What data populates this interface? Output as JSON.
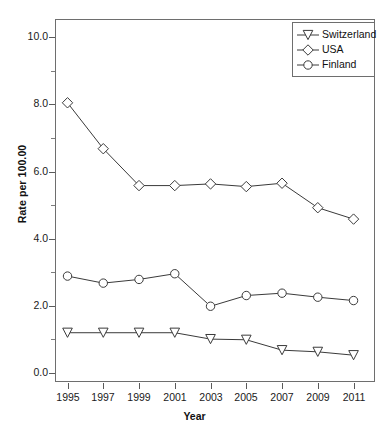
{
  "chart_data": {
    "type": "line",
    "title": "",
    "xlabel": "Year",
    "ylabel": "Rate per 100.00",
    "x": [
      1995,
      1997,
      1999,
      2001,
      2003,
      2005,
      2007,
      2009,
      2011
    ],
    "xtick_labels": [
      "1995",
      "1997",
      "1999",
      "2001",
      "2003",
      "2005",
      "2007",
      "2009",
      "2011"
    ],
    "ytick_labels": [
      "0.0",
      "2.0",
      "4.0",
      "6.0",
      "8.0",
      "10.0"
    ],
    "ytick_values": [
      0.0,
      2.0,
      4.0,
      6.0,
      8.0,
      10.0
    ],
    "yminor_values": [
      1.0,
      3.0,
      5.0,
      7.0,
      9.0
    ],
    "xlim": [
      1994.3,
      2012.2
    ],
    "ylim": [
      -0.28,
      10.55
    ],
    "grid": false,
    "legend_position": "top-right",
    "series": [
      {
        "name": "Switzerland",
        "marker": "inverted-triangle",
        "color": "#3a3a3a",
        "values": [
          1.19,
          1.19,
          1.19,
          1.19,
          1.0,
          0.98,
          0.67,
          0.62,
          0.52
        ]
      },
      {
        "name": "USA",
        "marker": "diamond",
        "color": "#3a3a3a",
        "values": [
          8.05,
          6.68,
          5.58,
          5.58,
          5.63,
          5.55,
          5.65,
          4.92,
          4.58
        ]
      },
      {
        "name": "Finland",
        "marker": "circle",
        "color": "#3a3a3a",
        "values": [
          2.88,
          2.67,
          2.78,
          2.95,
          1.98,
          2.3,
          2.37,
          2.25,
          2.15
        ]
      }
    ]
  },
  "legend": {
    "entries": [
      {
        "label": "Switzerland",
        "marker": "inverted-triangle"
      },
      {
        "label": "USA",
        "marker": "diamond"
      },
      {
        "label": "Finland",
        "marker": "circle"
      }
    ]
  },
  "axes": {
    "y_title": "Rate per 100.00",
    "x_title": "Year"
  }
}
